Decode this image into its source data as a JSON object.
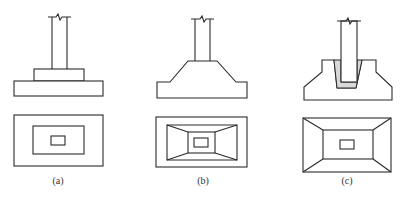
{
  "figure": {
    "panels": [
      {
        "id": "a",
        "label": "(a)",
        "type": "stepped footing",
        "elevation": "column on stepped pedestal block over rectangular slab",
        "plan": "three nested rectangles"
      },
      {
        "id": "b",
        "label": "(b)",
        "type": "sloped (tapered) footing",
        "elevation": "column on trapezoidal sloped footing",
        "plan": "outer rectangle, sloped trapezoid faces, inner column rectangle"
      },
      {
        "id": "c",
        "label": "(c)",
        "type": "socket (cup) footing for precast column",
        "elevation": "precast column set in grouted socket of sloped footing",
        "plan": "rectangle with sloped faces and small socket rectangle"
      }
    ],
    "colors": {
      "line": "#2a2a2a",
      "grout": "#d8d8d8",
      "background": "#ffffff"
    }
  }
}
